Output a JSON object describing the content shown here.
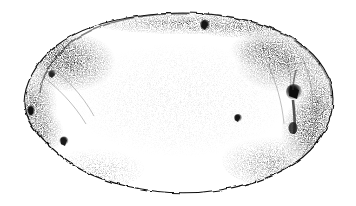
{
  "figure": {
    "title": "Potato tuber",
    "medium": "stipple pen-and-ink line drawing",
    "view": "lateral whole tuber",
    "caption": "",
    "background_color": "#ffffff",
    "ink_color": "#1a1a1a",
    "stipple_color": "#2b2b2b",
    "outline_color": "#111111",
    "canvas": {
      "width": 356,
      "height": 206
    }
  },
  "chart_data": {
    "type": "scatter",
    "xlabel": "",
    "ylabel": "",
    "xlim": [
      0,
      356
    ],
    "ylim": [
      0,
      206
    ],
    "grid": false,
    "legend": "none",
    "annotations": [],
    "outline_path": "M 24 104 C 24 84 36 62 56 46 C 78 29 108 20 140 16 C 170 12 198 12 224 16 C 252 20 278 28 298 42 C 320 57 333 78 333 99 C 333 120 322 141 303 157 C 282 174 252 185 220 190 C 188 195 156 193 126 186 C 96 179 70 166 52 149 C 34 132 24 118 24 104 Z",
    "shape_metrics": {
      "bbox_left": 22,
      "bbox_top": 12,
      "bbox_right": 334,
      "bbox_bottom": 193,
      "width_px": 312,
      "height_px": 181,
      "aspect_ratio": 1.72
    },
    "eyes": [
      {
        "name": "eye-top-center",
        "x": 205,
        "y": 25,
        "r": 4.2,
        "darkness": 0.92
      },
      {
        "name": "eye-right-major",
        "x": 294,
        "y": 92,
        "r": 6.5,
        "darkness": 1.0
      },
      {
        "name": "eye-center-right",
        "x": 238,
        "y": 118,
        "r": 3.4,
        "darkness": 0.85
      },
      {
        "name": "eye-left-edge",
        "x": 31,
        "y": 111,
        "r": 3.6,
        "darkness": 0.9
      },
      {
        "name": "eye-lower-left",
        "x": 64,
        "y": 141,
        "r": 3.6,
        "darkness": 0.82
      },
      {
        "name": "eye-upper-left",
        "x": 52,
        "y": 74,
        "r": 3.2,
        "darkness": 0.7
      }
    ],
    "shade_regions": [
      {
        "name": "shoulder-upper-left",
        "cx": 70,
        "cy": 62,
        "rx": 46,
        "ry": 30,
        "intensity": 0.85
      },
      {
        "name": "flank-left",
        "cx": 40,
        "cy": 104,
        "rx": 22,
        "ry": 34,
        "intensity": 0.7
      },
      {
        "name": "crest-top",
        "cx": 185,
        "cy": 22,
        "rx": 95,
        "ry": 12,
        "intensity": 0.55
      },
      {
        "name": "shoulder-upper-right",
        "cx": 280,
        "cy": 62,
        "rx": 48,
        "ry": 30,
        "intensity": 0.75
      },
      {
        "name": "flank-right",
        "cx": 312,
        "cy": 110,
        "rx": 24,
        "ry": 46,
        "intensity": 0.8
      },
      {
        "name": "base-lower-right",
        "cx": 272,
        "cy": 160,
        "rx": 50,
        "ry": 26,
        "intensity": 0.45
      },
      {
        "name": "base-lower-left",
        "cx": 96,
        "cy": 168,
        "rx": 48,
        "ry": 22,
        "intensity": 0.35
      },
      {
        "name": "body-center",
        "cx": 180,
        "cy": 100,
        "rx": 110,
        "ry": 58,
        "intensity": 0.08
      }
    ],
    "values": [
      0.85,
      0.7,
      0.55,
      0.75,
      0.8,
      0.45,
      0.35,
      0.08
    ],
    "categories": [
      "shoulder-upper-left",
      "flank-left",
      "crest-top",
      "shoulder-upper-right",
      "flank-right",
      "base-lower-right",
      "base-lower-left",
      "body-center"
    ]
  }
}
